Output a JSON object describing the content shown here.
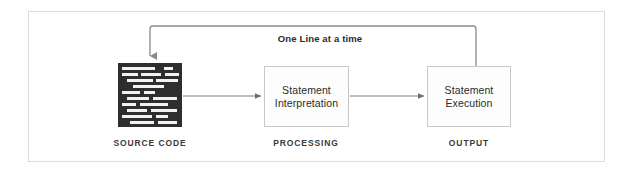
{
  "diagram": {
    "frame": {
      "border_color": "#dcdcdc"
    },
    "feedback": {
      "label": "One Line at a time",
      "line_color": "#8a8a8a",
      "direction": "from-execution-to-source"
    },
    "nodes": [
      {
        "id": "source-code",
        "type": "code-block",
        "caption": "SOURCE CODE",
        "fill": "#2e2e2e",
        "line_color": "#f2f2f2"
      },
      {
        "id": "statement-interpretation",
        "type": "process-box",
        "label_line_1": "Statement",
        "label_line_2": "Interpretation",
        "caption": "PROCESSING",
        "border": "#c9c9c9",
        "fill": "#fdfdfd"
      },
      {
        "id": "statement-execution",
        "type": "process-box",
        "label_line_1": "Statement",
        "label_line_2": "Execution",
        "caption": "OUTPUT",
        "border": "#c9c9c9",
        "fill": "#fdfdfd"
      }
    ],
    "connectors": [
      {
        "id": "source-to-interpretation",
        "from": "source-code",
        "to": "statement-interpretation",
        "style": "arrow-right",
        "color": "#7d7d7d"
      },
      {
        "id": "interpretation-to-execution",
        "from": "statement-interpretation",
        "to": "statement-execution",
        "style": "arrow-right",
        "color": "#7d7d7d"
      },
      {
        "id": "execution-to-source-feedback",
        "from": "statement-execution",
        "to": "source-code",
        "style": "arrow-down-elbow",
        "color": "#8a8a8a"
      }
    ],
    "code_rows": [
      {
        "x": 4,
        "y": 4,
        "w": 33
      },
      {
        "x": 46,
        "y": 4,
        "w": 9
      },
      {
        "x": 4,
        "y": 10,
        "w": 16
      },
      {
        "x": 23,
        "y": 10,
        "w": 20
      },
      {
        "x": 47,
        "y": 10,
        "w": 14
      },
      {
        "x": 9,
        "y": 16,
        "w": 26
      },
      {
        "x": 38,
        "y": 16,
        "w": 22
      },
      {
        "x": 15,
        "y": 22,
        "w": 31
      },
      {
        "x": 4,
        "y": 28,
        "w": 18
      },
      {
        "x": 26,
        "y": 28,
        "w": 11
      },
      {
        "x": 9,
        "y": 34,
        "w": 22
      },
      {
        "x": 35,
        "y": 34,
        "w": 24
      },
      {
        "x": 4,
        "y": 40,
        "w": 14
      },
      {
        "x": 22,
        "y": 40,
        "w": 28
      },
      {
        "x": 9,
        "y": 46,
        "w": 20
      },
      {
        "x": 33,
        "y": 46,
        "w": 26
      },
      {
        "x": 4,
        "y": 52,
        "w": 30
      },
      {
        "x": 38,
        "y": 52,
        "w": 12
      },
      {
        "x": 12,
        "y": 58,
        "w": 24
      },
      {
        "x": 40,
        "y": 58,
        "w": 19
      }
    ]
  }
}
